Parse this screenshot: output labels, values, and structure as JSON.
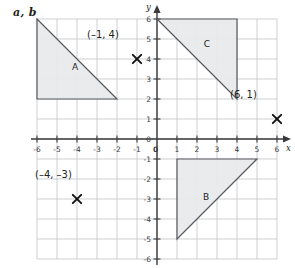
{
  "problem": {
    "label": "a, b"
  },
  "chart_data": {
    "type": "scatter",
    "title": "",
    "xlabel": "x",
    "ylabel": "y",
    "xlim": [
      -6,
      6
    ],
    "ylim": [
      -6,
      6
    ],
    "grid": true,
    "legend": "none",
    "x_ticks": [
      -6,
      -5,
      -4,
      -3,
      -2,
      -1,
      0,
      1,
      2,
      3,
      4,
      5,
      6
    ],
    "y_ticks": [
      -6,
      -5,
      -4,
      -3,
      -2,
      -1,
      0,
      1,
      2,
      3,
      4,
      5,
      6
    ],
    "x_tick_labels": [
      "-6",
      "-5",
      "-4",
      "-3",
      "-2",
      "-1",
      "0",
      "1",
      "2",
      "3",
      "4",
      "5",
      "6"
    ],
    "y_tick_labels": [
      "-6",
      "-5",
      "-4",
      "-3",
      "-2",
      "-1",
      "0",
      "1",
      "2",
      "3",
      "4",
      "5",
      "6"
    ],
    "origin_label": "0",
    "shapes": [
      {
        "name": "A",
        "label": "A",
        "kind": "triangle",
        "vertices": [
          [
            -6,
            6
          ],
          [
            -6,
            2
          ],
          [
            -2,
            2
          ]
        ],
        "label_at": [
          -4.1,
          3.6
        ],
        "fill": "#e9eaec",
        "stroke": "#56585c"
      },
      {
        "name": "B",
        "label": "B",
        "kind": "triangle",
        "vertices": [
          [
            1,
            -1
          ],
          [
            5,
            -1
          ],
          [
            1,
            -5
          ]
        ],
        "label_at": [
          2.45,
          -2.9
        ],
        "fill": "#e9eaec",
        "stroke": "#56585c"
      },
      {
        "name": "C",
        "label": "C",
        "kind": "triangle",
        "vertices": [
          [
            0,
            6
          ],
          [
            4,
            6
          ],
          [
            4,
            2
          ]
        ],
        "label_at": [
          2.5,
          4.75
        ],
        "fill": "#e9eaec",
        "stroke": "#56585c"
      }
    ],
    "points": [
      {
        "name": "point-neg1-4",
        "label": "(–1, 4)",
        "x": -1,
        "y": 4,
        "marker": "x",
        "label_at": [
          -3.5,
          5.05
        ]
      },
      {
        "name": "point-6-1",
        "label": "(6, 1)",
        "x": 6,
        "y": 1,
        "marker": "x",
        "label_at": [
          3.65,
          2.05
        ]
      },
      {
        "name": "point-neg4-neg3",
        "label": "(–4, –3)",
        "x": -4,
        "y": -3,
        "marker": "x",
        "label_at": [
          -6.1,
          -1.95
        ]
      }
    ]
  },
  "colors": {
    "grid": "#b9bcc0",
    "axis": "#3a3a3c",
    "shape_fill": "#e9eaec",
    "shape_stroke": "#56585c",
    "marker": "#111111",
    "text": "#231f20"
  }
}
